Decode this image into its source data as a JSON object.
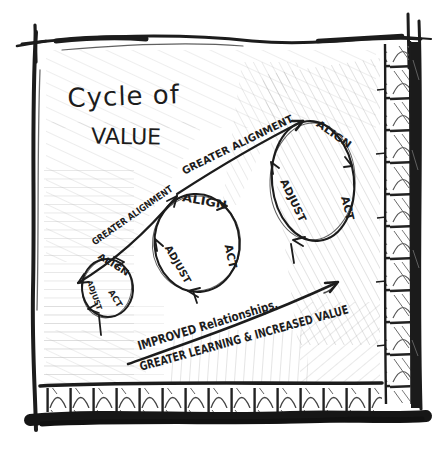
{
  "title": {
    "line1": "Cycle of",
    "line2": "VALUE"
  },
  "growth_arrow": {
    "label_lower": "GREATER ALIGNMENT",
    "label_upper": "GREATER ALIGNMENT"
  },
  "cycles": {
    "small": {
      "align": "ALIGN",
      "act": "ACT",
      "adjust": "ADJUST"
    },
    "medium": {
      "align": "ALIGN",
      "act": "ACT",
      "adjust": "ADJUST"
    },
    "large": {
      "align": "ALIGN",
      "act": "ACT",
      "adjust": "ADJUST"
    }
  },
  "outcome_arrow": {
    "line1": "IMPROVED Relationships,",
    "line2": "GREATER LEARNING & INCREASED VALUE"
  },
  "colors": {
    "ink": "#1c1c1c",
    "paper": "#ffffff",
    "pencil": "#ababab"
  }
}
